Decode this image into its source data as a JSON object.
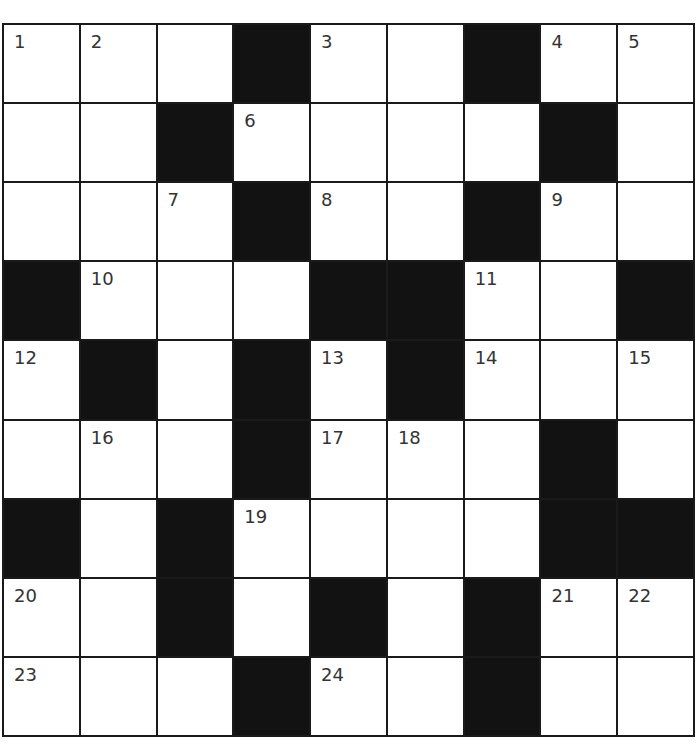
{
  "puzzle": {
    "rows": 9,
    "cols": 9,
    "colors": {
      "block": "#121212",
      "cell": "#ffffff",
      "line": "#1a1a1a",
      "number": "#333333"
    },
    "grid": [
      [
        "1",
        "2",
        "",
        "#",
        "3",
        "",
        "#",
        "4",
        "5"
      ],
      [
        "",
        "",
        "#",
        "6",
        "",
        "",
        "",
        "#",
        ""
      ],
      [
        "",
        "",
        "7",
        "#",
        "8",
        "",
        "#",
        "9",
        ""
      ],
      [
        "#",
        "10",
        "",
        "",
        "#",
        "#",
        "11",
        "",
        "#"
      ],
      [
        "12",
        "#",
        "",
        "#",
        "13",
        "#",
        "14",
        "",
        "15"
      ],
      [
        "",
        "16",
        "",
        "#",
        "17",
        "18",
        "",
        "#",
        ""
      ],
      [
        "#",
        "",
        "#",
        "19",
        "",
        "",
        "",
        "#",
        "#"
      ],
      [
        "20",
        "",
        "#",
        "",
        "#",
        "",
        "#",
        "21",
        "22"
      ],
      [
        "23",
        "",
        "",
        "#",
        "24",
        "",
        "#",
        "",
        ""
      ]
    ]
  }
}
